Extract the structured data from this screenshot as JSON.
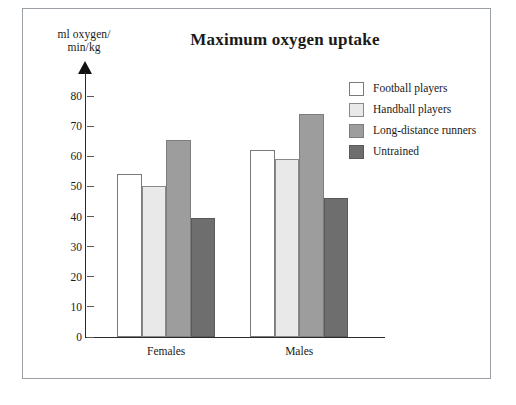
{
  "chart_data": {
    "type": "bar",
    "title": "Maximum oxygen uptake",
    "ylabel_line1": "ml oxygen/",
    "ylabel_line2": "min/kg",
    "xlabel": "",
    "categories": [
      "Females",
      "Males"
    ],
    "series": [
      {
        "name": "Football players",
        "values": [
          54,
          62
        ],
        "color": "#ffffff"
      },
      {
        "name": "Handball players",
        "values": [
          50,
          59
        ],
        "color": "#e9e9e9"
      },
      {
        "name": "Long-distance runners",
        "values": [
          65.5,
          74
        ],
        "color": "#9d9d9d"
      },
      {
        "name": "Untrained",
        "values": [
          39.5,
          46
        ],
        "color": "#6e6e6e"
      }
    ],
    "ylim": [
      0,
      88
    ],
    "yticks": [
      0,
      10,
      20,
      30,
      40,
      50,
      60,
      70,
      80
    ],
    "ytick_labels": [
      "0",
      "10",
      "20",
      "30",
      "40",
      "50",
      "60",
      "70",
      "80"
    ],
    "grid": false,
    "legend_position": "top-right",
    "axis_arrow": true
  },
  "legend": {
    "entries": [
      {
        "label": "Football players"
      },
      {
        "label": "Handball players"
      },
      {
        "label": "Long-distance runners"
      },
      {
        "label": "Untrained"
      }
    ]
  }
}
